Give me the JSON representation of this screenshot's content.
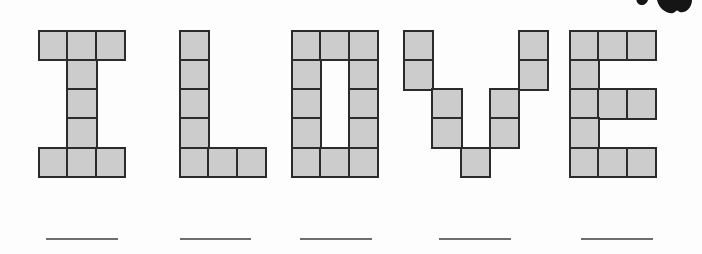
{
  "word": "I LOVE",
  "colors": {
    "background": "#fdfdfd",
    "cell_fill": "#cccccc",
    "cell_border": "#2b2b2b",
    "blank_line": "#6e6e6e",
    "corner_shape": "#151515"
  },
  "grid": {
    "cell_w": 28.7,
    "cell_h": 29.2,
    "top": 31,
    "border": 2.5,
    "rows": 5
  },
  "letters": [
    {
      "char": "I",
      "x": 39,
      "cols": 3,
      "cells": [
        [
          0,
          0
        ],
        [
          1,
          0
        ],
        [
          2,
          0
        ],
        [
          1,
          1
        ],
        [
          1,
          2
        ],
        [
          1,
          3
        ],
        [
          0,
          4
        ],
        [
          1,
          4
        ],
        [
          2,
          4
        ]
      ]
    },
    {
      "char": "L",
      "x": 180,
      "cols": 3,
      "cells": [
        [
          0,
          0
        ],
        [
          0,
          1
        ],
        [
          0,
          2
        ],
        [
          0,
          3
        ],
        [
          0,
          4
        ],
        [
          1,
          4
        ],
        [
          2,
          4
        ]
      ]
    },
    {
      "char": "O",
      "x": 292,
      "cols": 3,
      "cells": [
        [
          0,
          0
        ],
        [
          1,
          0
        ],
        [
          2,
          0
        ],
        [
          0,
          1
        ],
        [
          2,
          1
        ],
        [
          0,
          2
        ],
        [
          2,
          2
        ],
        [
          0,
          3
        ],
        [
          2,
          3
        ],
        [
          0,
          4
        ],
        [
          1,
          4
        ],
        [
          2,
          4
        ]
      ]
    },
    {
      "char": "V",
      "x": 404,
      "cols": 5,
      "cells": [
        [
          0,
          0
        ],
        [
          4,
          0
        ],
        [
          0,
          1
        ],
        [
          4,
          1
        ],
        [
          1,
          2
        ],
        [
          3,
          2
        ],
        [
          1,
          3
        ],
        [
          3,
          3
        ],
        [
          2,
          4
        ]
      ]
    },
    {
      "char": "E",
      "x": 570,
      "cols": 3,
      "cells": [
        [
          0,
          0
        ],
        [
          1,
          0
        ],
        [
          2,
          0
        ],
        [
          0,
          1
        ],
        [
          0,
          2
        ],
        [
          1,
          2
        ],
        [
          2,
          2
        ],
        [
          0,
          3
        ],
        [
          0,
          4
        ],
        [
          1,
          4
        ],
        [
          2,
          4
        ]
      ]
    }
  ],
  "blanks": [
    {
      "for_char": "I",
      "x": 46,
      "y": 238,
      "w": 72
    },
    {
      "for_char": "L",
      "x": 180,
      "y": 238,
      "w": 71
    },
    {
      "for_char": "O",
      "x": 300,
      "y": 238,
      "w": 72
    },
    {
      "for_char": "V",
      "x": 439,
      "y": 238,
      "w": 72
    },
    {
      "for_char": "E",
      "x": 581,
      "y": 238,
      "w": 72
    }
  ],
  "corner_shapes": [
    {
      "name": "small-blob",
      "path": "M636.5,0 L648,0 C647.2,3.2 644.0,5.6 640.6,4.9 C638.0,4.3 636.5,2.3 636.5,0 Z"
    },
    {
      "name": "large-blob",
      "path": "M657,0 C658,5 661,9 665.5,11.6 C669.5,13.8 673.5,13.6 675.5,11.4 C676.5,10.3 677.6,10.3 678.8,11.4 C681.2,13.2 685.2,12.4 688,9.6 C690.8,6.8 692,3.4 692,0 Z"
    }
  ]
}
